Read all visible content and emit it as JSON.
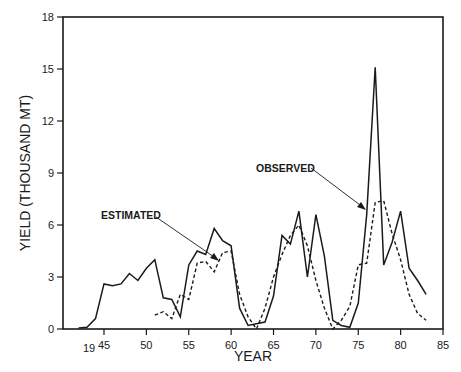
{
  "chart_data": {
    "type": "line",
    "title": "",
    "xlabel": "YEAR",
    "ylabel": "YIELD (THOUSAND MT)",
    "xlim": [
      40.2,
      85
    ],
    "ylim": [
      0,
      18
    ],
    "x_ticks": [
      45,
      50,
      55,
      60,
      65,
      70,
      75,
      80,
      85
    ],
    "x_tick_labels": [
      "45",
      "50",
      "55",
      "60",
      "65",
      "70",
      "75",
      "80",
      "85"
    ],
    "x_century_label": "19",
    "y_ticks": [
      0,
      3,
      6,
      9,
      12,
      15,
      18
    ],
    "y_tick_labels": [
      "0",
      "3",
      "6",
      "9",
      "12",
      "15",
      "18"
    ],
    "grid": false,
    "legend": "none (inline annotations)",
    "annotations": [
      {
        "text": "ESTIMATED",
        "points_to_series": "Estimated",
        "arrow_target_year": 59,
        "arrow_target_value": 4.5
      },
      {
        "text": "OBSERVED",
        "points_to_series": "Observed",
        "arrow_target_year": 76,
        "arrow_target_value": 6.5
      }
    ],
    "series": [
      {
        "name": "Observed",
        "style": "solid",
        "x": [
          42,
          43,
          44,
          45,
          46,
          47,
          48,
          49,
          50,
          51,
          52,
          53,
          54,
          55,
          56,
          57,
          58,
          59,
          60,
          61,
          62,
          63,
          64,
          65,
          66,
          67,
          68,
          69,
          70,
          71,
          72,
          73,
          74,
          75,
          76,
          77,
          78,
          79,
          80,
          81,
          82,
          83
        ],
        "values": [
          0.05,
          0.1,
          0.6,
          2.6,
          2.5,
          2.6,
          3.2,
          2.8,
          3.5,
          4.0,
          1.8,
          1.7,
          0.7,
          3.7,
          4.5,
          4.3,
          5.8,
          5.1,
          4.8,
          1.2,
          0.2,
          0.3,
          0.4,
          1.9,
          5.4,
          4.9,
          6.8,
          3.0,
          6.6,
          4.2,
          0.5,
          0.2,
          0.1,
          1.5,
          6.6,
          15.1,
          3.7,
          5.0,
          6.8,
          3.5,
          2.8,
          2.0
        ]
      },
      {
        "name": "Estimated",
        "style": "dashed",
        "x": [
          51,
          52,
          53,
          54,
          55,
          56,
          57,
          58,
          59,
          60,
          61,
          62,
          63,
          64,
          65,
          66,
          67,
          68,
          69,
          70,
          71,
          72,
          73,
          74,
          75,
          76,
          77,
          78,
          79,
          80,
          81,
          82,
          83
        ],
        "values": [
          0.8,
          1.0,
          0.6,
          2.0,
          1.7,
          3.8,
          3.9,
          3.3,
          4.4,
          4.5,
          2.0,
          0.7,
          0.0,
          1.2,
          3.0,
          4.3,
          5.4,
          6.0,
          4.8,
          2.8,
          1.2,
          0.0,
          0.5,
          1.3,
          3.7,
          3.8,
          7.3,
          7.4,
          5.5,
          4.0,
          2.0,
          0.9,
          0.5
        ]
      }
    ]
  },
  "colors": {
    "ink": "#1a1a1a",
    "background": "#ffffff"
  }
}
